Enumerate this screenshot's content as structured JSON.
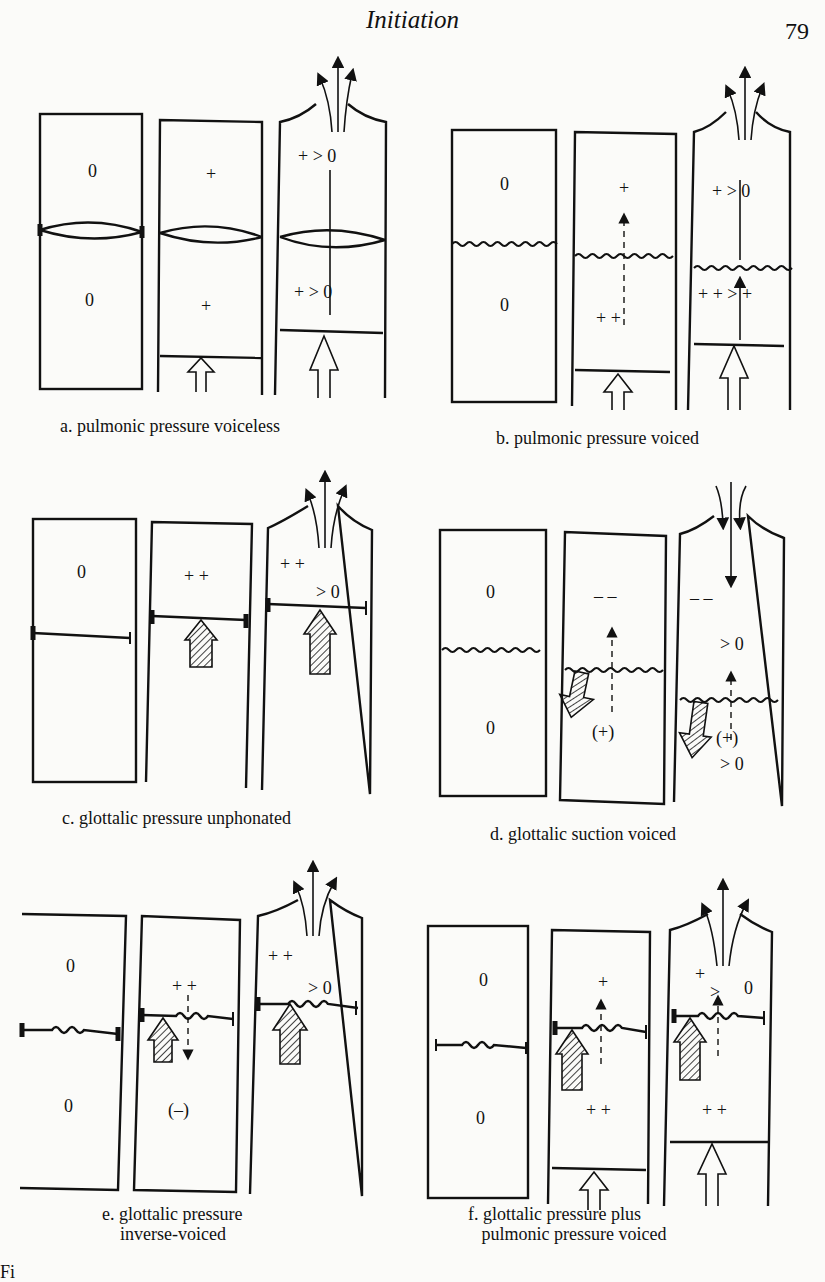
{
  "page": {
    "running_head": "Initiation",
    "page_number": "79",
    "footer_fragment": "Fi"
  },
  "figure": {
    "panels": [
      {
        "id": "a",
        "caption": "a. pulmonic pressure voiceless",
        "columns": [
          {
            "upper": "0",
            "lower": "0"
          },
          {
            "upper": "+",
            "lower": "+"
          },
          {
            "upper": "+ > 0",
            "lower": "+ > 0"
          }
        ]
      },
      {
        "id": "b",
        "caption": "b. pulmonic pressure voiced",
        "columns": [
          {
            "upper": "0",
            "lower": "0"
          },
          {
            "upper": "+",
            "lower": "+   +"
          },
          {
            "upper": "+ > 0",
            "lower": "+ +  > +"
          }
        ]
      },
      {
        "id": "c",
        "caption": "c. glottalic pressure unphonated",
        "columns": [
          {
            "upper": "0",
            "lower": ""
          },
          {
            "upper": "+ +",
            "lower": ""
          },
          {
            "upper": "+ +  > 0",
            "lower": ""
          }
        ]
      },
      {
        "id": "d",
        "caption": "d. glottalic suction voiced",
        "columns": [
          {
            "upper": "0",
            "lower": "0"
          },
          {
            "upper": "– –",
            "lower": "(+)"
          },
          {
            "upper": "– –  > 0",
            "lower": "(+) > 0"
          }
        ]
      },
      {
        "id": "e",
        "caption": "e. glottalic pressure\n    inverse-voiced",
        "columns": [
          {
            "upper": "0",
            "lower": "0"
          },
          {
            "upper": "+ +",
            "lower": "(–)"
          },
          {
            "upper": "+ +  > 0",
            "lower": ""
          }
        ]
      },
      {
        "id": "f",
        "caption": "f. glottalic pressure plus\n   pulmonic pressure voiced",
        "columns": [
          {
            "upper": "0",
            "lower": "0"
          },
          {
            "upper": "+",
            "lower": "+ +"
          },
          {
            "upper": "+ > 0",
            "lower": "+ +"
          }
        ]
      }
    ],
    "labels": {
      "zero": "0",
      "plus": "+",
      "plusplus": "+ +",
      "gt": ">",
      "gt0": "> 0",
      "minusminus": "– –",
      "paren_plus": "(+)",
      "paren_minus": "(–)",
      "plus_plus_spaced": "+      +"
    }
  }
}
